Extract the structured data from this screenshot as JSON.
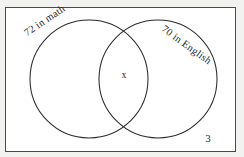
{
  "figure": {
    "type": "venn-diagram",
    "page_number": "3",
    "frame": {
      "border_color": "#4a4a4a",
      "background_color": "#ffffff"
    },
    "page_background_color": "#f2f2f0",
    "stroke_color": "#2b2b2b",
    "sets": [
      {
        "id": "math",
        "label": "72 in math",
        "count": 72,
        "subject": "math",
        "center_x": 89,
        "center_y": 79,
        "radius": 59,
        "label_rotation_deg": -34
      },
      {
        "id": "english",
        "label": "70 in English",
        "count": 70,
        "subject": "English",
        "center_x": 158,
        "center_y": 79,
        "radius": 59,
        "label_rotation_deg": 36
      }
    ],
    "intersection": {
      "marker": "x",
      "description": "unknown overlap quantity",
      "x": 123,
      "y": 76
    }
  }
}
